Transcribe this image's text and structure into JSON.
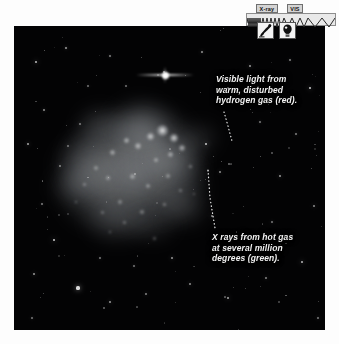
{
  "page": {
    "background_color": "#fdfdfd",
    "image_background_color": "#030304"
  },
  "image_frame": {
    "name": "astronomical-image",
    "subject": "diffuse nebula / galaxy with bright knots",
    "nebula_color": "#b9bcc0",
    "star_color": "#ffffff"
  },
  "annotations": [
    {
      "id": "visible-light",
      "text": "Visible light from\nwarm, disturbed\nhydrogen gas (red).",
      "color": "#f2f2f2",
      "leader_from": [
        222,
        114
      ],
      "leader_to": [
        232,
        141
      ]
    },
    {
      "id": "xray",
      "text": "X rays from hot gas\nat several million\ndegrees (green).",
      "color": "#f2f2f2",
      "leader_from": [
        210,
        170
      ],
      "leader_to": [
        216,
        228
      ]
    }
  ],
  "spectrum_widget": {
    "name": "wavelength-band-selector",
    "bands": [
      {
        "id": "xray",
        "label": "X-ray",
        "icon": "telescope-icon",
        "selected": true
      },
      {
        "id": "vis",
        "label": "VIS",
        "icon": "eye-icon",
        "selected": false
      }
    ],
    "wave_strip": {
      "name": "electromagnetic-spectrum-strip",
      "background_color": "#e9e9e9",
      "border_color": "#8d8d8d"
    }
  },
  "chart_data": {
    "type": "heatmap",
    "xlabel": "",
    "ylabel": "",
    "legend_position": "in-figure annotations",
    "series": [
      {
        "name": "Visible light (H-alpha, red)",
        "description": "warm, disturbed hydrogen gas"
      },
      {
        "name": "X-ray (green)",
        "description": "hot gas at several million degrees"
      }
    ],
    "annotations": [
      "Visible light from warm, disturbed hydrogen gas (red).",
      "X rays from hot gas at several million degrees (green)."
    ]
  }
}
